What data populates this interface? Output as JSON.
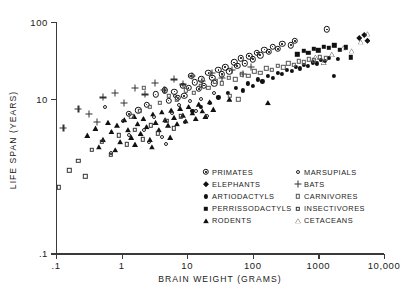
{
  "chart_data": {
    "type": "scatter",
    "title": "",
    "xlabel": "BRAIN WEIGHT (GRAMS)",
    "ylabel": "LIFE SPAN (YEARS)",
    "xscale": "log",
    "yscale": "log",
    "xlim": [
      0.1,
      10000
    ],
    "ylim": [
      0.1,
      100
    ],
    "xticks": [
      0.1,
      1,
      10,
      100,
      1000,
      10000
    ],
    "xticklabels": [
      ".1",
      "1",
      "10",
      "100",
      "1000",
      "10,000"
    ],
    "yticks": [
      0.1,
      10,
      100
    ],
    "yticklabels": [
      ".1",
      "10",
      "100"
    ],
    "grid": false,
    "legend_position": "inside-lower-right",
    "series": [
      {
        "name": "PRIMATES",
        "marker": "circle-dot",
        "points": [
          [
            3.3,
            11.5
          ],
          [
            4.6,
            13.0
          ],
          [
            5.2,
            9.6
          ],
          [
            6.4,
            12.5
          ],
          [
            7.2,
            10.4
          ],
          [
            8.5,
            15.0
          ],
          [
            9.0,
            11.0
          ],
          [
            10.5,
            14.0
          ],
          [
            11.5,
            20.0
          ],
          [
            13.0,
            16.5
          ],
          [
            15.0,
            13.5
          ],
          [
            16.5,
            18.0
          ],
          [
            18.0,
            15.0
          ],
          [
            21.0,
            22.0
          ],
          [
            24.0,
            19.0
          ],
          [
            26.0,
            16.0
          ],
          [
            30.0,
            24.0
          ],
          [
            34.0,
            21.0
          ],
          [
            38.0,
            26.0
          ],
          [
            44.0,
            23.0
          ],
          [
            52.0,
            30.0
          ],
          [
            58.0,
            27.0
          ],
          [
            66.0,
            34.0
          ],
          [
            76.0,
            29.0
          ],
          [
            88.0,
            36.0
          ],
          [
            100.0,
            33.0
          ],
          [
            115.0,
            40.0
          ],
          [
            130.0,
            37.0
          ],
          [
            150.0,
            44.0
          ],
          [
            175.0,
            41.0
          ],
          [
            200.0,
            48.0
          ],
          [
            240.0,
            45.0
          ],
          [
            280.0,
            52.0
          ],
          [
            380.0,
            50.0
          ],
          [
            440.0,
            57.0
          ],
          [
            1350.0,
            80.0
          ],
          [
            2.4,
            8.5
          ],
          [
            1.8,
            7.2
          ],
          [
            1.3,
            6.4
          ]
        ]
      },
      {
        "name": "ELEPHANTS",
        "marker": "filled-diamond",
        "points": [
          [
            4200.0,
            62.0
          ],
          [
            5000.0,
            68.0
          ],
          [
            5600.0,
            57.0
          ]
        ]
      },
      {
        "name": "ARTIODACTYLS",
        "marker": "filled-circle-small",
        "points": [
          [
            22.0,
            9.0
          ],
          [
            30.0,
            10.5
          ],
          [
            42.0,
            12.0
          ],
          [
            55.0,
            14.0
          ],
          [
            70.0,
            13.0
          ],
          [
            85.0,
            16.0
          ],
          [
            100.0,
            15.0
          ],
          [
            120.0,
            18.0
          ],
          [
            140.0,
            17.0
          ],
          [
            170.0,
            20.0
          ],
          [
            200.0,
            19.0
          ],
          [
            240.0,
            22.0
          ],
          [
            280.0,
            21.0
          ],
          [
            330.0,
            24.0
          ],
          [
            390.0,
            23.0
          ],
          [
            450.0,
            26.0
          ],
          [
            520.0,
            25.0
          ],
          [
            600.0,
            28.0
          ],
          [
            700.0,
            27.0
          ],
          [
            820.0,
            30.0
          ],
          [
            950.0,
            29.0
          ],
          [
            1100.0,
            32.0
          ],
          [
            1250.0,
            31.0
          ],
          [
            1450.0,
            34.0
          ],
          [
            1700.0,
            20.0
          ],
          [
            2000.0,
            33.0
          ],
          [
            16.0,
            8.0
          ],
          [
            12.0,
            7.0
          ]
        ]
      },
      {
        "name": "PERRISSODACTYLS",
        "marker": "filled-square",
        "points": [
          [
            480.0,
            38.0
          ],
          [
            600.0,
            42.0
          ],
          [
            700.0,
            40.0
          ],
          [
            850.0,
            45.0
          ],
          [
            1000.0,
            43.0
          ],
          [
            1200.0,
            48.0
          ],
          [
            1450.0,
            46.0
          ],
          [
            1750.0,
            50.0
          ],
          [
            2100.0,
            44.0
          ],
          [
            2600.0,
            47.0
          ],
          [
            3100.0,
            35.0
          ]
        ]
      },
      {
        "name": "RODENTS",
        "marker": "filled-triangle",
        "points": [
          [
            0.3,
            3.4
          ],
          [
            0.4,
            4.2
          ],
          [
            0.52,
            3.0
          ],
          [
            0.62,
            5.0
          ],
          [
            0.7,
            3.8
          ],
          [
            0.85,
            4.6
          ],
          [
            0.95,
            2.8
          ],
          [
            1.1,
            5.4
          ],
          [
            1.25,
            4.0
          ],
          [
            1.4,
            3.2
          ],
          [
            1.55,
            6.0
          ],
          [
            1.75,
            4.8
          ],
          [
            1.95,
            3.6
          ],
          [
            2.15,
            5.6
          ],
          [
            2.4,
            4.4
          ],
          [
            2.7,
            3.0
          ],
          [
            3.0,
            6.4
          ],
          [
            3.3,
            5.0
          ],
          [
            3.7,
            4.0
          ],
          [
            4.1,
            6.8
          ],
          [
            4.6,
            5.4
          ],
          [
            5.1,
            4.6
          ],
          [
            5.7,
            7.2
          ],
          [
            6.3,
            5.8
          ],
          [
            7.0,
            4.8
          ],
          [
            7.8,
            7.6
          ],
          [
            8.6,
            6.2
          ],
          [
            9.5,
            5.2
          ],
          [
            10.5,
            8.0
          ],
          [
            12.0,
            6.6
          ],
          [
            13.5,
            5.6
          ],
          [
            15.0,
            8.6
          ],
          [
            17.0,
            7.0
          ],
          [
            19.0,
            6.0
          ],
          [
            22.0,
            9.2
          ],
          [
            25.0,
            7.4
          ],
          [
            0.45,
            2.4
          ],
          [
            0.8,
            2.2
          ],
          [
            1.6,
            2.6
          ],
          [
            2.9,
            2.4
          ],
          [
            5.5,
            3.2
          ],
          [
            44.0,
            10.0
          ],
          [
            170.0,
            9.0
          ]
        ]
      },
      {
        "name": "MARSUPIALS",
        "marker": "open-circle-small",
        "points": [
          [
            0.55,
            8.0
          ],
          [
            1.05,
            5.2
          ],
          [
            1.3,
            3.4
          ],
          [
            2.2,
            4.0
          ],
          [
            3.1,
            5.8
          ],
          [
            4.2,
            3.2
          ],
          [
            5.8,
            6.6
          ],
          [
            7.4,
            8.4
          ],
          [
            9.2,
            5.0
          ],
          [
            11.0,
            9.4
          ],
          [
            13.5,
            7.0
          ],
          [
            16.0,
            10.0
          ],
          [
            2.6,
            2.8
          ],
          [
            4.8,
            2.6
          ],
          [
            6.5,
            11.0
          ],
          [
            0.7,
            2.0
          ],
          [
            20.0,
            6.0
          ],
          [
            26.0,
            12.0
          ]
        ]
      },
      {
        "name": "BATS",
        "marker": "plus",
        "points": [
          [
            0.13,
            4.2
          ],
          [
            0.32,
            6.4
          ],
          [
            0.52,
            10.5
          ],
          [
            0.78,
            12.0
          ],
          [
            1.1,
            9.0
          ],
          [
            1.6,
            14.0
          ],
          [
            2.3,
            11.5
          ],
          [
            3.2,
            16.0
          ],
          [
            4.5,
            13.0
          ],
          [
            6.2,
            18.0
          ],
          [
            8.5,
            15.5
          ],
          [
            12.0,
            20.0
          ],
          [
            17.0,
            17.0
          ],
          [
            24.0,
            22.0
          ],
          [
            34.0,
            19.0
          ],
          [
            48.0,
            24.0
          ],
          [
            70.0,
            21.0
          ],
          [
            95.0,
            26.0
          ],
          [
            0.22,
            7.5
          ],
          [
            0.42,
            5.0
          ]
        ]
      },
      {
        "name": "CARNIVORES",
        "marker": "open-square",
        "points": [
          [
            3.8,
            9.0
          ],
          [
            5.2,
            11.0
          ],
          [
            7.0,
            10.0
          ],
          [
            9.5,
            13.0
          ],
          [
            12.5,
            12.0
          ],
          [
            16.0,
            15.0
          ],
          [
            21.0,
            14.0
          ],
          [
            27.0,
            17.0
          ],
          [
            34.0,
            16.0
          ],
          [
            43.0,
            19.0
          ],
          [
            54.0,
            18.0
          ],
          [
            68.0,
            21.0
          ],
          [
            85.0,
            20.0
          ],
          [
            105.0,
            23.0
          ],
          [
            130.0,
            22.0
          ],
          [
            160.0,
            25.0
          ],
          [
            195.0,
            24.0
          ],
          [
            240.0,
            27.0
          ],
          [
            290.0,
            26.0
          ],
          [
            350.0,
            29.0
          ],
          [
            420.0,
            28.0
          ],
          [
            500.0,
            31.0
          ],
          [
            600.0,
            30.0
          ],
          [
            720.0,
            33.0
          ],
          [
            860.0,
            32.0
          ],
          [
            1050.0,
            35.0
          ],
          [
            1300.0,
            34.0
          ],
          [
            2.7,
            8.0
          ],
          [
            1.9,
            7.0
          ],
          [
            1.4,
            6.0
          ],
          [
            2.2,
            14.0
          ],
          [
            45.0,
            11.0
          ],
          [
            60.0,
            10.0
          ]
        ]
      },
      {
        "name": "INSECTIVORES",
        "marker": "open-square-small",
        "points": [
          [
            0.11,
            0.72
          ],
          [
            0.22,
            1.6
          ],
          [
            0.35,
            2.2
          ],
          [
            0.5,
            2.8
          ],
          [
            0.68,
            1.9
          ],
          [
            0.9,
            3.4
          ],
          [
            1.2,
            2.6
          ],
          [
            1.6,
            4.0
          ],
          [
            2.1,
            3.0
          ],
          [
            2.8,
            4.6
          ],
          [
            3.6,
            3.6
          ],
          [
            4.8,
            5.2
          ],
          [
            0.16,
            1.2
          ],
          [
            0.28,
            1.0
          ],
          [
            6.2,
            4.2
          ],
          [
            8.0,
            6.0
          ]
        ]
      },
      {
        "name": "CETACEANS",
        "marker": "open-triangle",
        "points": [
          [
            1600.0,
            38.0
          ],
          [
            2400.0,
            46.0
          ],
          [
            3200.0,
            42.0
          ],
          [
            4400.0,
            55.0
          ],
          [
            5600.0,
            70.0
          ],
          [
            900.0,
            35.0
          ],
          [
            1200.0,
            30.0
          ]
        ]
      }
    ]
  },
  "legend": {
    "left_column": [
      {
        "label": "PRIMATES",
        "marker": "primates"
      },
      {
        "label": "ELEPHANTS",
        "marker": "elephants"
      },
      {
        "label": "ARTIODACTYLS",
        "marker": "artiodactyls"
      },
      {
        "label": "PERRISSODACTYLS",
        "marker": "perrissodactyls"
      },
      {
        "label": "RODENTS",
        "marker": "rodents"
      }
    ],
    "right_column": [
      {
        "label": "MARSUPIALS",
        "marker": "marsupials"
      },
      {
        "label": "BATS",
        "marker": "bats"
      },
      {
        "label": "CARNIVORES",
        "marker": "carnivores"
      },
      {
        "label": "INSECTIVORES",
        "marker": "insectivores"
      },
      {
        "label": "CETACEANS",
        "marker": "cetaceans"
      }
    ]
  },
  "colors": {
    "axis": "#3a3a3a",
    "marker": "#111111",
    "background": "#ffffff"
  }
}
